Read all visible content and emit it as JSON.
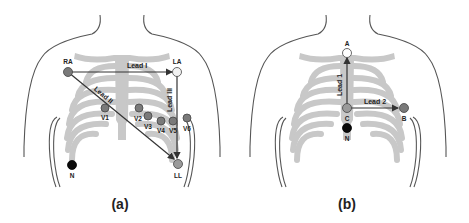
{
  "figure": {
    "panels": [
      {
        "id": "a",
        "caption": "(a)",
        "electrodes": [
          {
            "label": "RA",
            "role": "limb",
            "fill": "#7a7a7a"
          },
          {
            "label": "LA",
            "role": "limb",
            "fill": "#f2f2f2"
          },
          {
            "label": "LL",
            "role": "limb",
            "fill": "#9a9a9a"
          },
          {
            "label": "N",
            "role": "neutral",
            "fill": "#0a0a0a"
          },
          {
            "label": "V1",
            "role": "precordial",
            "fill": "#7a7a7a"
          },
          {
            "label": "V2",
            "role": "precordial",
            "fill": "#7a7a7a"
          },
          {
            "label": "V3",
            "role": "precordial",
            "fill": "#7a7a7a"
          },
          {
            "label": "V4",
            "role": "precordial",
            "fill": "#7a7a7a"
          },
          {
            "label": "V5",
            "role": "precordial",
            "fill": "#7a7a7a"
          },
          {
            "label": "V6",
            "role": "precordial",
            "fill": "#7a7a7a"
          }
        ],
        "leads": [
          {
            "label": "Lead I",
            "from": "RA",
            "to": "LA"
          },
          {
            "label": "Lead II",
            "from": "RA",
            "to": "LL"
          },
          {
            "label": "Lead III",
            "from": "LA",
            "to": "LL"
          }
        ]
      },
      {
        "id": "b",
        "caption": "(b)",
        "electrodes": [
          {
            "label": "A",
            "role": "electrode",
            "fill": "#ffffff"
          },
          {
            "label": "C",
            "role": "electrode",
            "fill": "#9a9a9a"
          },
          {
            "label": "B",
            "role": "electrode",
            "fill": "#7a7a7a"
          },
          {
            "label": "N",
            "role": "neutral",
            "fill": "#0a0a0a"
          }
        ],
        "leads": [
          {
            "label": "Lead 1",
            "from": "C",
            "to": "A"
          },
          {
            "label": "Lead 2",
            "from": "C",
            "to": "B"
          }
        ]
      }
    ],
    "colors": {
      "ribcage": "#c8c8c8",
      "body_outline": "#555555",
      "lead_line": "#333333",
      "text": "#222222"
    }
  }
}
